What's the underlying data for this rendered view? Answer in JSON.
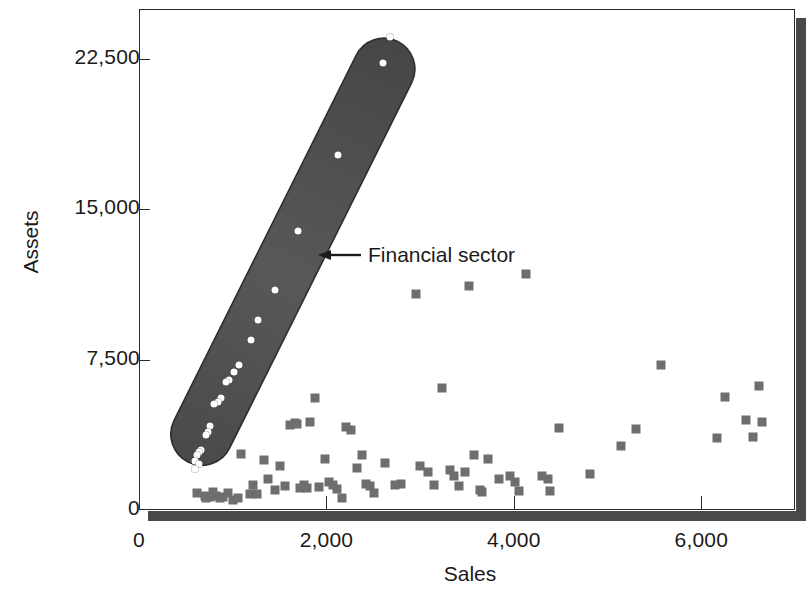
{
  "chart_data": {
    "type": "scatter",
    "title": "",
    "xlabel": "Sales",
    "ylabel": "Assets",
    "xlim": [
      0,
      7000
    ],
    "ylim": [
      0,
      25000
    ],
    "grid": false,
    "legend_position": "none",
    "xticks": [
      {
        "value": 0,
        "label": "0"
      },
      {
        "value": 2000,
        "label": "2,000"
      },
      {
        "value": 4000,
        "label": "4,000"
      },
      {
        "value": 6000,
        "label": "6,000"
      }
    ],
    "yticks": [
      {
        "value": 0,
        "label": "0"
      },
      {
        "value": 7500,
        "label": "7,500"
      },
      {
        "value": 15000,
        "label": "15,000"
      },
      {
        "value": 22500,
        "label": "22,500"
      }
    ],
    "annotations": [
      {
        "text": "Financial sector",
        "marker": "arrow-left-icon",
        "points_to_x": 2450,
        "points_to_y": 13000
      }
    ],
    "highlight_region": {
      "label": "Financial sector",
      "shape": "capsule",
      "color": "#4d4d4d",
      "x_start": 500,
      "y_start": 500,
      "x_end": 2700,
      "y_end": 24100,
      "width_units": 520
    },
    "series": [
      {
        "name": "Financial sector",
        "marker": "circle",
        "color": "#ffffff",
        "points": [
          [
            2680,
            23600
          ],
          [
            2600,
            22300
          ],
          [
            2120,
            17700
          ],
          [
            1700,
            13900
          ],
          [
            1450,
            11000
          ],
          [
            1270,
            9500
          ],
          [
            1190,
            8500
          ],
          [
            1070,
            7250
          ],
          [
            1010,
            6900
          ],
          [
            960,
            6500
          ],
          [
            930,
            6400
          ],
          [
            870,
            5600
          ],
          [
            840,
            5400
          ],
          [
            800,
            5300
          ],
          [
            760,
            4200
          ],
          [
            740,
            3900
          ],
          [
            720,
            3750
          ],
          [
            660,
            3000
          ],
          [
            640,
            2900
          ],
          [
            620,
            2750
          ],
          [
            600,
            2450
          ],
          [
            640,
            2300
          ],
          [
            600,
            2050
          ]
        ]
      },
      {
        "name": "Other sectors",
        "marker": "square",
        "color": "#6e6e6e",
        "points": [
          [
            620,
            860
          ],
          [
            700,
            700
          ],
          [
            720,
            620
          ],
          [
            760,
            640
          ],
          [
            790,
            900
          ],
          [
            820,
            700
          ],
          [
            860,
            620
          ],
          [
            900,
            660
          ],
          [
            950,
            830
          ],
          [
            1000,
            520
          ],
          [
            1060,
            600
          ],
          [
            1090,
            2800
          ],
          [
            1180,
            800
          ],
          [
            1220,
            1250
          ],
          [
            1260,
            780
          ],
          [
            1330,
            2500
          ],
          [
            1380,
            1550
          ],
          [
            1450,
            1000
          ],
          [
            1500,
            2200
          ],
          [
            1560,
            1200
          ],
          [
            1610,
            4250
          ],
          [
            1660,
            4350
          ],
          [
            1690,
            4280
          ],
          [
            1720,
            1100
          ],
          [
            1760,
            1250
          ],
          [
            1790,
            1100
          ],
          [
            1830,
            4400
          ],
          [
            1880,
            5600
          ],
          [
            1920,
            1150
          ],
          [
            1990,
            2550
          ],
          [
            2030,
            1400
          ],
          [
            2070,
            1250
          ],
          [
            2110,
            1050
          ],
          [
            2170,
            620
          ],
          [
            2210,
            4150
          ],
          [
            2260,
            4000
          ],
          [
            2330,
            2100
          ],
          [
            2380,
            2750
          ],
          [
            2420,
            1300
          ],
          [
            2470,
            1180
          ],
          [
            2510,
            850
          ],
          [
            2620,
            2350
          ],
          [
            2730,
            1250
          ],
          [
            2800,
            1300
          ],
          [
            2960,
            10800
          ],
          [
            3000,
            2200
          ],
          [
            3080,
            1900
          ],
          [
            3150,
            1250
          ],
          [
            3230,
            6100
          ],
          [
            3320,
            2000
          ],
          [
            3360,
            1700
          ],
          [
            3410,
            1200
          ],
          [
            3480,
            1900
          ],
          [
            3520,
            11200
          ],
          [
            3570,
            2750
          ],
          [
            3640,
            1000
          ],
          [
            3660,
            900
          ],
          [
            3720,
            2550
          ],
          [
            3840,
            1550
          ],
          [
            3960,
            1700
          ],
          [
            4010,
            1400
          ],
          [
            4060,
            960
          ],
          [
            4130,
            11800
          ],
          [
            4300,
            1700
          ],
          [
            4360,
            1550
          ],
          [
            4390,
            950
          ],
          [
            4480,
            4100
          ],
          [
            4810,
            1800
          ],
          [
            5140,
            3200
          ],
          [
            5300,
            4050
          ],
          [
            5570,
            7250
          ],
          [
            6170,
            3600
          ],
          [
            6250,
            5650
          ],
          [
            6480,
            4500
          ],
          [
            6550,
            3650
          ],
          [
            6620,
            6200
          ],
          [
            6650,
            4400
          ]
        ]
      }
    ]
  }
}
